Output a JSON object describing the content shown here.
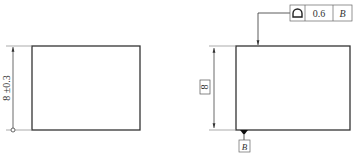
{
  "figure_left": {
    "dimension_text": "8 ±0.3",
    "rectangle": {
      "x": 32,
      "y": 46,
      "w": 108,
      "h": 84
    }
  },
  "figure_right": {
    "dimension_text": "8",
    "dimension_boxed": true,
    "rectangle": {
      "x": 236,
      "y": 46,
      "w": 114,
      "h": 84
    },
    "feature_control_frame": {
      "symbol": "profile-of-a-surface",
      "symbol_glyph": "D",
      "tolerance": "0.6",
      "datum": "B"
    },
    "datum_label": "B"
  },
  "caption": ""
}
